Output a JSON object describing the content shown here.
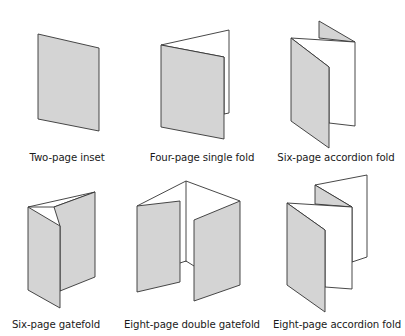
{
  "colors": {
    "page_fill": "#d4d4d4",
    "outline": "#333333",
    "background": "#ffffff"
  },
  "folds": [
    {
      "id": "two-page-inset",
      "label": "Two-page inset",
      "pages": 2
    },
    {
      "id": "four-page-single-fold",
      "label": "Four-page single fold",
      "pages": 4
    },
    {
      "id": "six-page-accordion-fold",
      "label": "Six-page accordion fold",
      "pages": 6
    },
    {
      "id": "six-page-gatefold",
      "label": "Six-page gatefold",
      "pages": 6
    },
    {
      "id": "eight-page-double-gatefold",
      "label": "Eight-page double gatefold",
      "pages": 8
    },
    {
      "id": "eight-page-accordion-fold",
      "label": "Eight-page accordion fold",
      "pages": 8
    }
  ]
}
